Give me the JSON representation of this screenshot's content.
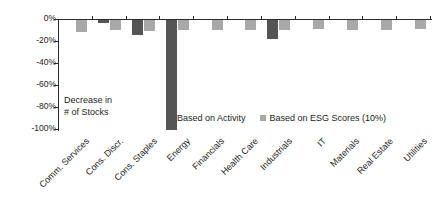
{
  "chart_data": {
    "type": "bar",
    "title": "",
    "subtitle": "",
    "xlabel": "",
    "ylabel": "Decrease in # of Stocks",
    "ylim": [
      -100,
      0
    ],
    "grid": false,
    "legend_position": "inside-bottom-center",
    "orientation": "vertical",
    "grouping": "grouped",
    "categories": [
      "Comm. Services",
      "Cons. Discr.",
      "Cons. Staples",
      "Energy",
      "Financials",
      "Health Care",
      "Industrials",
      "IT",
      "Materials",
      "Real Estate",
      "Utilities"
    ],
    "series": [
      {
        "name": "Based on Activity",
        "color": "#555555",
        "values": [
          0,
          -3,
          -14,
          -100,
          0,
          0,
          -17,
          0,
          0,
          0,
          0
        ]
      },
      {
        "name": "Based on ESG Scores (10%)",
        "color": "#a8a8a8",
        "values": [
          -11,
          -9,
          -10,
          -9,
          -9,
          -9,
          -9,
          -8,
          -9,
          -9,
          -8
        ]
      }
    ],
    "ytick_labels": [
      "0%",
      "-20%",
      "-40%",
      "-60%",
      "-80%",
      "-100%"
    ],
    "ytick_values": [
      0,
      -20,
      -40,
      -60,
      -80,
      -100
    ],
    "annotations": [
      {
        "name": "axis-note",
        "line1": "Decrease in",
        "line2": "# of Stocks"
      }
    ]
  },
  "legend": {
    "items": [
      {
        "label": "Based on Activity",
        "color": "#555555"
      },
      {
        "label": "Based on ESG Scores (10%)",
        "color": "#a8a8a8"
      }
    ]
  },
  "annotation": {
    "line1": "Decrease in",
    "line2": "# of Stocks"
  }
}
